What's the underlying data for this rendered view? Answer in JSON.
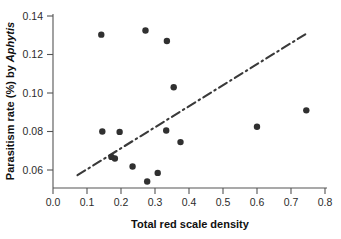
{
  "chart_data": {
    "type": "scatter",
    "title": "",
    "xlabel": "Total red scale density",
    "ylabel": "Parasitism rate (%) by Aphytis",
    "ylabel_plain": "Parasitism rate (%) by ",
    "ylabel_italic": "Aphytis",
    "xlim": [
      0.0,
      0.8
    ],
    "ylim": [
      0.05,
      0.14
    ],
    "xticks": [
      0.0,
      0.1,
      0.2,
      0.3,
      0.4,
      0.5,
      0.6,
      0.7,
      0.8
    ],
    "xtick_labels": [
      "0.0",
      "0.1",
      "0.2",
      "0.3",
      "0.4",
      "0.5",
      "0.6",
      "0.7",
      "0.8"
    ],
    "yticks": [
      0.06,
      0.08,
      0.1,
      0.12,
      0.14
    ],
    "ytick_labels": [
      "0.06",
      "0.08",
      "0.10",
      "0.12",
      "0.14"
    ],
    "grid": false,
    "legend": false,
    "marker": "filled-circle",
    "marker_color": "#303030",
    "points": [
      {
        "x": 0.142,
        "y": 0.1303
      },
      {
        "x": 0.272,
        "y": 0.1325
      },
      {
        "x": 0.335,
        "y": 0.127
      },
      {
        "x": 0.355,
        "y": 0.103
      },
      {
        "x": 0.745,
        "y": 0.091
      },
      {
        "x": 0.6,
        "y": 0.0825
      },
      {
        "x": 0.145,
        "y": 0.08
      },
      {
        "x": 0.196,
        "y": 0.0798
      },
      {
        "x": 0.333,
        "y": 0.0805
      },
      {
        "x": 0.375,
        "y": 0.0745
      },
      {
        "x": 0.172,
        "y": 0.0668
      },
      {
        "x": 0.182,
        "y": 0.066
      },
      {
        "x": 0.234,
        "y": 0.0618
      },
      {
        "x": 0.308,
        "y": 0.0585
      },
      {
        "x": 0.277,
        "y": 0.054
      }
    ],
    "fit_line": {
      "style": "dash-dot",
      "color": "#3a3a3a",
      "x_start": 0.072,
      "y_start": 0.0573,
      "x_end": 0.742,
      "y_end": 0.1305
    }
  }
}
